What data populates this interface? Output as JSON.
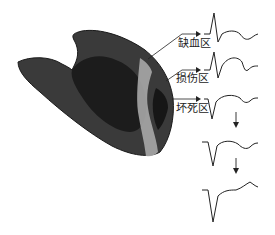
{
  "figure": {
    "zones": [
      {
        "id": "ischemia",
        "label": "缺血区"
      },
      {
        "id": "injury",
        "label": "损伤区"
      },
      {
        "id": "necrosis",
        "label": "坏死区"
      }
    ],
    "ecg_sequence_count": 5,
    "colors": {
      "myocardium": "#3a3a3a",
      "myocardium_inner": "#1e1e1e",
      "highlight_band": "#a8a8a8",
      "line": "#222222",
      "background": "#ffffff"
    }
  }
}
